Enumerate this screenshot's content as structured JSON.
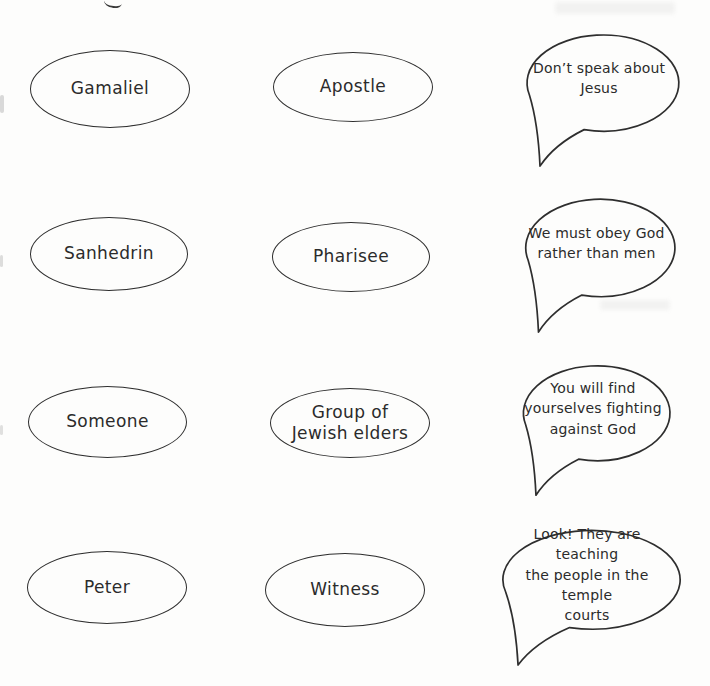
{
  "page": {
    "background_color": "#fdfdfc",
    "ink_color": "#2e2e2e"
  },
  "rows": [
    {
      "character": "Gamaliel",
      "role": "Apostle",
      "quote": [
        "Don’t speak about",
        "Jesus"
      ]
    },
    {
      "character": "Sanhedrin",
      "role": "Pharisee",
      "quote": [
        "We must obey God",
        "rather than men"
      ]
    },
    {
      "character": "Someone",
      "role": [
        "Group of",
        "Jewish elders"
      ],
      "quote": [
        "You will find",
        "yourselves fighting",
        "against God"
      ]
    },
    {
      "character": "Peter",
      "role": "Witness",
      "quote": [
        "Look! They are teaching",
        "the people in the temple",
        "courts"
      ]
    }
  ]
}
